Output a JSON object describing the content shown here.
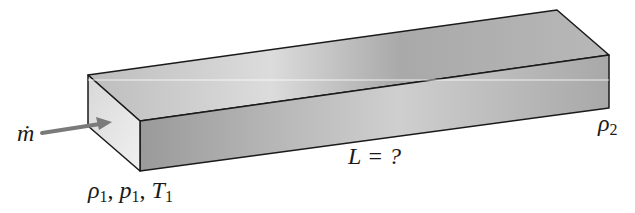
{
  "diagram": {
    "labels": {
      "inlet_mass_flow": "ṁ",
      "inlet_state": "ρ1, p1, T1",
      "inlet_rho": "ρ",
      "inlet_p": "p",
      "inlet_T": "T",
      "sub1": "1",
      "exit_rho": "ρ",
      "sub2": "2",
      "length_label": "L = ?",
      "sep": ", "
    },
    "colors": {
      "outline": "#1a1a1a",
      "arrow": "#7a7a7a",
      "top_face": "#b5b5b5",
      "front_face": "#a8a8a8",
      "end_face": "#e6e6e6"
    }
  }
}
